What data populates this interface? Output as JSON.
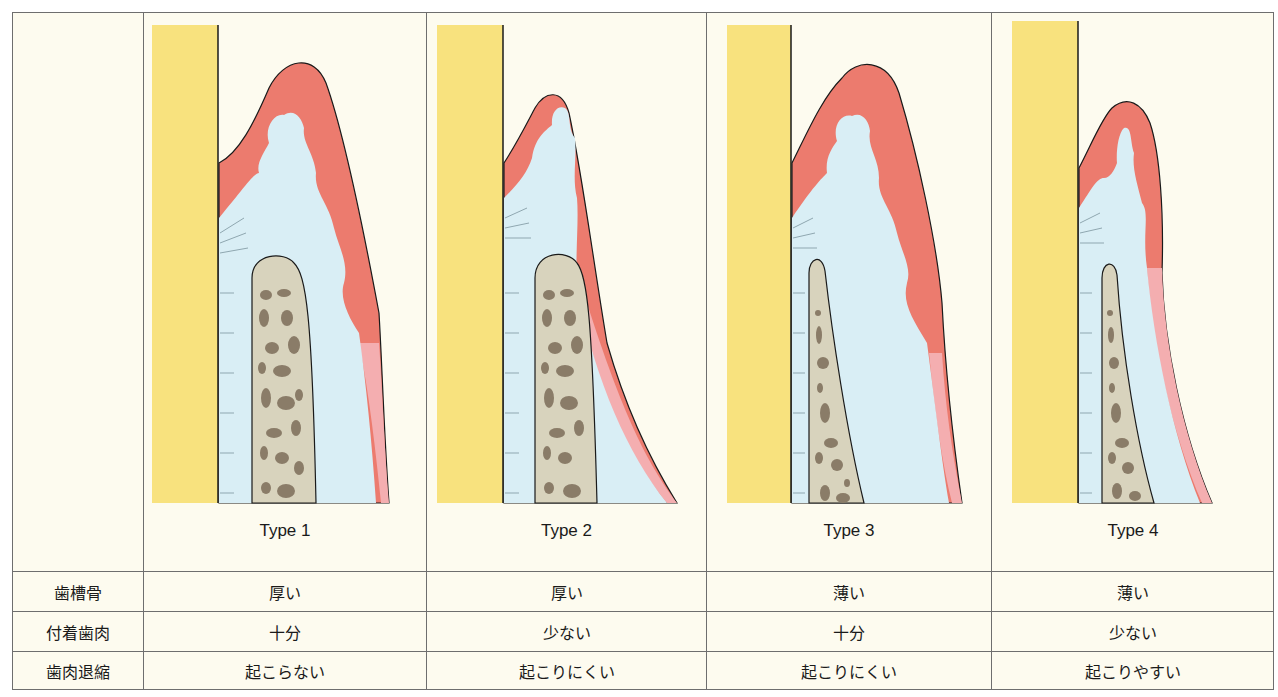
{
  "colors": {
    "background": "#fdfbef",
    "tooth": "#f8e27e",
    "gingiva_keratinized": "#ec7b6e",
    "gingiva_mucosa": "#f4aeb0",
    "connective_tissue": "#d9eef5",
    "bone": "#d8d3bd",
    "marrow": "#8a7c68",
    "line": "#1a1a1a",
    "grid": "#6e6e6e"
  },
  "panels": [
    {
      "label": "Type 1",
      "bone": "thick",
      "gingiva": "thick"
    },
    {
      "label": "Type 2",
      "bone": "thick",
      "gingiva": "thin"
    },
    {
      "label": "Type 3",
      "bone": "thin",
      "gingiva": "thick"
    },
    {
      "label": "Type 4",
      "bone": "thin",
      "gingiva": "thin"
    }
  ],
  "table": {
    "row_headers": [
      "歯槽骨",
      "付着歯肉",
      "歯肉退縮"
    ],
    "rows": [
      [
        "厚い",
        "厚い",
        "薄い",
        "薄い"
      ],
      [
        "十分",
        "少ない",
        "十分",
        "少ない"
      ],
      [
        "起こらない",
        "起こりにくい",
        "起こりにくい",
        "起こりやすい"
      ]
    ]
  }
}
